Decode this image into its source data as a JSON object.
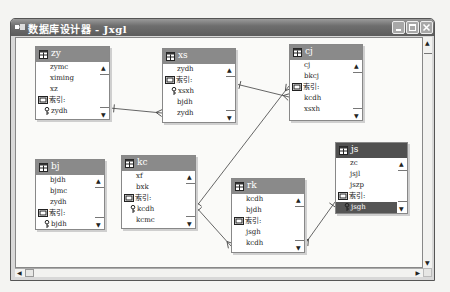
{
  "window": {
    "title": "数据库设计器 - Jxgl",
    "icon": "database-designer-icon",
    "controls": [
      "minimize",
      "maximize",
      "close"
    ]
  },
  "tables": [
    {
      "id": "zy",
      "name": "zy",
      "selected": false,
      "rows": [
        {
          "type": "field",
          "text": "zymc"
        },
        {
          "type": "field",
          "text": "ximing"
        },
        {
          "type": "field",
          "text": "xz"
        },
        {
          "type": "index-header",
          "text": "索引:"
        },
        {
          "type": "key",
          "text": "zydh"
        }
      ]
    },
    {
      "id": "xs",
      "name": "xs",
      "selected": false,
      "rows": [
        {
          "type": "field",
          "text": "zydh"
        },
        {
          "type": "index-header",
          "text": "索引:"
        },
        {
          "type": "key",
          "text": "xsxh"
        },
        {
          "type": "field",
          "text": "bjdh"
        },
        {
          "type": "field",
          "text": "zydh"
        }
      ]
    },
    {
      "id": "cj",
      "name": "cj",
      "selected": false,
      "rows": [
        {
          "type": "field",
          "text": "cj"
        },
        {
          "type": "field",
          "text": "bkcj"
        },
        {
          "type": "index-header",
          "text": "索引:"
        },
        {
          "type": "field",
          "text": "kcdh"
        },
        {
          "type": "field",
          "text": "xsxh"
        }
      ]
    },
    {
      "id": "bj",
      "name": "bj",
      "selected": false,
      "rows": [
        {
          "type": "field",
          "text": "bjdh"
        },
        {
          "type": "field",
          "text": "bjmc"
        },
        {
          "type": "field",
          "text": "zydh"
        },
        {
          "type": "index-header",
          "text": "索引:"
        },
        {
          "type": "key",
          "text": "bjdh"
        }
      ]
    },
    {
      "id": "kc",
      "name": "kc",
      "selected": false,
      "rows": [
        {
          "type": "field",
          "text": "xf"
        },
        {
          "type": "field",
          "text": "bxk"
        },
        {
          "type": "index-header",
          "text": "索引:"
        },
        {
          "type": "key",
          "text": "kcdh"
        },
        {
          "type": "field",
          "text": "kcmc"
        }
      ]
    },
    {
      "id": "rk",
      "name": "rk",
      "selected": false,
      "rows": [
        {
          "type": "field",
          "text": "kcdh"
        },
        {
          "type": "field",
          "text": "bjdh"
        },
        {
          "type": "index-header",
          "text": "索引:"
        },
        {
          "type": "field",
          "text": "jsgh"
        },
        {
          "type": "field",
          "text": "kcdh"
        }
      ]
    },
    {
      "id": "js",
      "name": "js",
      "selected": true,
      "rows": [
        {
          "type": "field",
          "text": "zc"
        },
        {
          "type": "field",
          "text": "jsjl"
        },
        {
          "type": "field",
          "text": "jszp"
        },
        {
          "type": "index-header",
          "text": "索引:"
        },
        {
          "type": "key",
          "text": "jsgh",
          "selected": true
        }
      ]
    }
  ],
  "relationships": [
    {
      "from": "zy",
      "to": "xs"
    },
    {
      "from": "xs",
      "to": "cj"
    },
    {
      "from": "kc",
      "to": "cj"
    },
    {
      "from": "kc",
      "to": "rk"
    },
    {
      "from": "js",
      "to": "rk"
    }
  ],
  "colors": {
    "title_bar": "#6e6e6e",
    "table_header": "#8a8a8a",
    "table_header_selected": "#505050",
    "selected_row": "#555555"
  }
}
